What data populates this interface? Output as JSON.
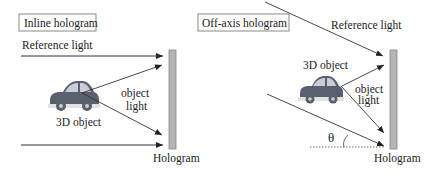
{
  "left_panel": {
    "title": "Inline hologram",
    "reference_light_label": "Reference light",
    "object_label": "3D object",
    "object_light_label_line1": "object",
    "object_light_label_line2": "light",
    "hologram_label": "Hologram"
  },
  "right_panel": {
    "title": "Off-axis hologram",
    "reference_light_label": "Reference light",
    "object_label": "3D object",
    "object_light_label_line1": "object",
    "object_light_label_line2": "light",
    "angle_label": "θ",
    "hologram_label": "Hologram"
  },
  "colors": {
    "hologram_plate": "#b5b5b5",
    "car_body": "#5a5f6e",
    "car_window": "#c9cdd6",
    "arrow": "#333333"
  }
}
